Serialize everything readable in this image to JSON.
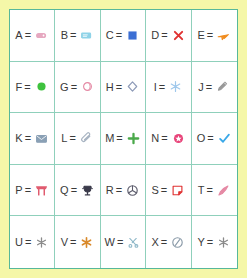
{
  "page": {
    "background_color": "#f5f7a8",
    "grid_border_color": "#57b89a",
    "cell_border_color": "#8fd0bb",
    "cell_background": "#ffffff",
    "text_color": "#3a3a3a",
    "equals": "="
  },
  "legend": {
    "title": "Letter to symbol legend",
    "rows": 5,
    "columns": 5,
    "entries": [
      {
        "letter": "A",
        "icon": "capsule-pill-icon",
        "color": "#e6a8c0",
        "description": "small pink capsule"
      },
      {
        "letter": "B",
        "icon": "note-card-icon",
        "color": "#8fd3e8",
        "description": "light blue card"
      },
      {
        "letter": "C",
        "icon": "filled-square-icon",
        "color": "#3b6fd4",
        "description": "blue filled square"
      },
      {
        "letter": "D",
        "icon": "cross-mark-icon",
        "color": "#e03131",
        "description": "red X mark"
      },
      {
        "letter": "E",
        "icon": "airplane-icon",
        "color": "#f08c1e",
        "description": "orange airplane"
      },
      {
        "letter": "F",
        "icon": "filled-circle-icon",
        "color": "#3ec23e",
        "description": "green filled circle"
      },
      {
        "letter": "G",
        "icon": "crescent-moon-icon",
        "color": "#e58aa5",
        "description": "pink crescent"
      },
      {
        "letter": "H",
        "icon": "diamond-outline-icon",
        "color": "#8e9bb8",
        "description": "outlined diamond"
      },
      {
        "letter": "I",
        "icon": "snowflake-icon",
        "color": "#9fc8ec",
        "description": "pale blue snowflake"
      },
      {
        "letter": "J",
        "icon": "pencil-icon",
        "color": "#9a9a9a",
        "description": "gray pencil"
      },
      {
        "letter": "K",
        "icon": "envelope-icon",
        "color": "#8aa0b5",
        "description": "gray envelope"
      },
      {
        "letter": "L",
        "icon": "paperclip-icon",
        "color": "#a8b4c2",
        "description": "gray paperclip"
      },
      {
        "letter": "M",
        "icon": "plus-cross-icon",
        "color": "#4aa94a",
        "description": "green cross"
      },
      {
        "letter": "N",
        "icon": "star-in-circle-icon",
        "color": "#e8447a",
        "description": "pink star badge"
      },
      {
        "letter": "O",
        "icon": "check-mark-icon",
        "color": "#3aa8e8",
        "description": "blue check mark"
      },
      {
        "letter": "P",
        "icon": "torii-gate-icon",
        "color": "#e05a6e",
        "description": "red torii gate"
      },
      {
        "letter": "Q",
        "icon": "trophy-icon",
        "color": "#3a3a4a",
        "description": "dark trophy"
      },
      {
        "letter": "R",
        "icon": "circled-fan-icon",
        "color": "#5a5a6a",
        "description": "circled fan symbol"
      },
      {
        "letter": "S",
        "icon": "sticky-note-icon",
        "color": "#e03131",
        "description": "red sticky note"
      },
      {
        "letter": "T",
        "icon": "brush-icon",
        "color": "#e58aa5",
        "description": "pink brush"
      },
      {
        "letter": "U",
        "icon": "asterisk-icon",
        "color": "#8a8a8a",
        "description": "gray asterisk"
      },
      {
        "letter": "V",
        "icon": "star-burst-icon",
        "color": "#d9892a",
        "description": "gold star burst"
      },
      {
        "letter": "W",
        "icon": "scissors-icon",
        "color": "#8fb8c8",
        "description": "light blue scissors"
      },
      {
        "letter": "X",
        "icon": "circled-slash-icon",
        "color": "#8a9aa8",
        "description": "circled slash"
      },
      {
        "letter": "Y",
        "icon": "asterisk-icon",
        "color": "#8a8a8a",
        "description": "gray asterisk"
      }
    ]
  }
}
